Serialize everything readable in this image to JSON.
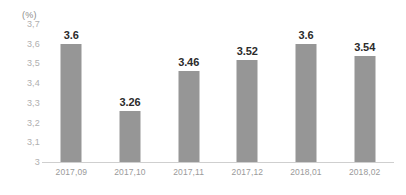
{
  "chart_data": {
    "type": "bar",
    "title": "",
    "xlabel": "",
    "ylabel": "(%)",
    "unit_caption": "(%)",
    "categories": [
      "2017,09",
      "2017,10",
      "2017,11",
      "2017,12",
      "2018,01",
      "2018,02"
    ],
    "values": [
      3.6,
      3.26,
      3.46,
      3.52,
      3.6,
      3.54
    ],
    "value_labels": [
      "3.6",
      "3.26",
      "3.46",
      "3.52",
      "3.6",
      "3.54"
    ],
    "ylim": [
      3,
      3.7
    ],
    "ytick_labels": [
      "3,7",
      "3,6",
      "3,5",
      "3,4",
      "3,3",
      "3,2",
      "3,1",
      "3"
    ],
    "ytick_values": [
      3.7,
      3.6,
      3.5,
      3.4,
      3.3,
      3.2,
      3.1,
      3
    ],
    "grid": false,
    "legend": "none",
    "series_color": "#969696",
    "axis_color": "#cfcfcf",
    "tick_text_color": "#b0b0b0",
    "category_text_color": "#9a9a9a",
    "value_text_color": "#2b2b2b",
    "background_color": "#ffffff"
  }
}
